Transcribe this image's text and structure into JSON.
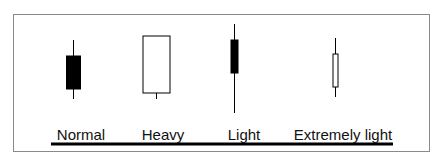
{
  "diagram": {
    "colors": {
      "frame": "#8a8a8a",
      "ink": "#000000"
    },
    "candles": [
      {
        "id": "normal",
        "label": "Normal",
        "body": "filled",
        "center_x": 73,
        "wick_top": 40,
        "wick_bottom": 99,
        "body_top": 56,
        "body_bottom": 89,
        "body_width": 14,
        "label_x": 81
      },
      {
        "id": "heavy",
        "label": "Heavy",
        "body": "hollow",
        "center_x": 156,
        "wick_top": 36,
        "wick_bottom": 99,
        "body_top": 36,
        "body_bottom": 93,
        "body_width": 27,
        "label_x": 163
      },
      {
        "id": "light",
        "label": "Light",
        "body": "filled",
        "center_x": 234,
        "wick_top": 24,
        "wick_bottom": 113,
        "body_top": 40,
        "body_bottom": 73,
        "body_width": 7,
        "label_x": 244
      },
      {
        "id": "extremely-light",
        "label": "Extremely light",
        "body": "hollow",
        "center_x": 335,
        "wick_top": 38,
        "wick_bottom": 97,
        "body_top": 54,
        "body_bottom": 87,
        "body_width": 5,
        "label_x": 343
      }
    ],
    "baseline": {
      "x1": 51,
      "x2": 393,
      "y": 144,
      "thickness": 3
    }
  }
}
